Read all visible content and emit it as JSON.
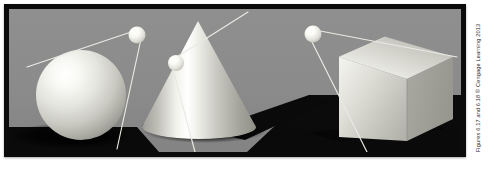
{
  "figure": {
    "kind": "textbook-lighting-figure",
    "credit": "Figures 6.17 and 6.18 © Cengage Learning 2013",
    "caption": "",
    "frame_color": "#0b0b0b",
    "backdrop_color": "#8d8d8d",
    "ground_shadow_color": "#0a0a0a",
    "light_color": "#f4f4f0",
    "ray_color": "#e8e8e2"
  },
  "scene": {
    "objects": [
      {
        "id": "sphere",
        "label": "Sphere",
        "center_x": 73,
        "center_y": 95,
        "radius": 45,
        "highlight_x": 58,
        "highlight_y": 62,
        "shadow_cx": 62,
        "shadow_cy": 139,
        "shadow_rx": 58,
        "shadow_ry": 11
      },
      {
        "id": "cone",
        "label": "Cone",
        "apex_x": 189,
        "apex_y": 18,
        "base_cx": 190,
        "base_cy": 128,
        "base_rx": 58,
        "base_ry": 12,
        "shadow_tip_x": 300,
        "shadow_tip_y": 100
      },
      {
        "id": "cube",
        "label": "Cube",
        "front_left": 348,
        "front_top": 58,
        "front_width": 62,
        "front_height": 82,
        "depth_x": 42,
        "depth_y": -22
      }
    ],
    "lights": [
      {
        "id": "light-1",
        "for": "sphere",
        "x": 134,
        "y": 32,
        "radius": 8.5
      },
      {
        "id": "light-2",
        "for": "cone",
        "x": 175,
        "y": 60,
        "radius": 8.0
      },
      {
        "id": "light-3",
        "for": "cube",
        "x": 310,
        "y": 31,
        "radius": 8.5
      }
    ],
    "rays": [
      {
        "id": "ray-sphere-tangent-upper",
        "x1": 22,
        "y1": 64,
        "x2": 137,
        "y2": 27
      },
      {
        "id": "ray-sphere-tangent-lower",
        "x1": 140,
        "y1": 36,
        "x2": 114,
        "y2": 145
      },
      {
        "id": "ray-cone-tangent-upper",
        "x1": 171,
        "y1": 57,
        "x2": 243,
        "y2": 9
      },
      {
        "id": "ray-cone-tangent-lower",
        "x1": 172,
        "y1": 66,
        "x2": 193,
        "y2": 153
      },
      {
        "id": "ray-cube-tangent-upper",
        "x1": 314,
        "y1": 27,
        "x2": 455,
        "y2": 54
      },
      {
        "id": "ray-cube-tangent-lower",
        "x1": 311,
        "y1": 39,
        "x2": 364,
        "y2": 151
      }
    ],
    "ground": {
      "horizon_y": 112,
      "left_shadow": {
        "x": 0,
        "y": 130,
        "w": 130,
        "h": 30
      },
      "right_shadow": {
        "x": 312,
        "y": 108,
        "w": 160,
        "h": 50
      }
    }
  }
}
